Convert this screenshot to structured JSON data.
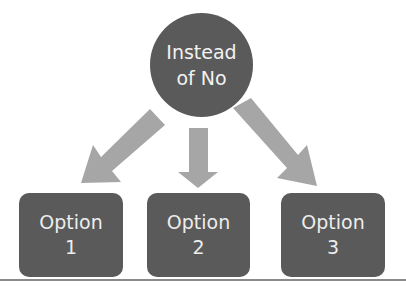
{
  "diagram": {
    "root": {
      "line1": "Instead",
      "line2": "of No"
    },
    "options": [
      {
        "line1": "Option",
        "line2": "1"
      },
      {
        "line1": "Option",
        "line2": "2"
      },
      {
        "line1": "Option",
        "line2": "3"
      }
    ],
    "colors": {
      "node_fill": "#5a5a5a",
      "node_text": "#f0f0f0",
      "arrow_fill": "#a6a6a6",
      "divider": "#8a8a8a"
    }
  }
}
